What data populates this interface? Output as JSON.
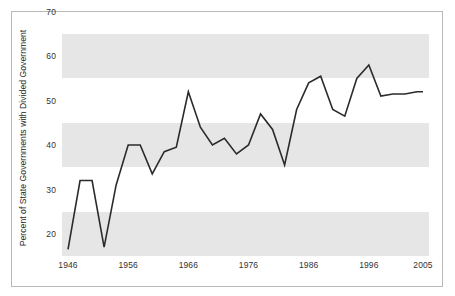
{
  "chart_data": {
    "type": "line",
    "title": "",
    "xlabel": "",
    "ylabel": "Percent of State Governments with Divided Government",
    "xlim": [
      1945,
      2006
    ],
    "ylim": [
      20,
      70
    ],
    "ytick_labels": [
      "20",
      "30",
      "40",
      "50",
      "60",
      "70"
    ],
    "ytick_values": [
      20,
      30,
      40,
      50,
      60,
      70
    ],
    "xtick_labels": [
      "1946",
      "1956",
      "1966",
      "1976",
      "1986",
      "1996",
      "2005"
    ],
    "xtick_values": [
      1946,
      1956,
      1966,
      1976,
      1986,
      1996,
      2005
    ],
    "grid": "alternating horizontal bands",
    "legend": "none",
    "line_color": "#2b2b2b",
    "band_color": "#e6e6e6",
    "plot_background": "#ffffff",
    "frame_color": "#b9b9b9",
    "x": [
      1946,
      1948,
      1950,
      1952,
      1954,
      1956,
      1958,
      1960,
      1962,
      1964,
      1966,
      1968,
      1970,
      1972,
      1974,
      1976,
      1978,
      1980,
      1982,
      1984,
      1986,
      1988,
      1990,
      1992,
      1994,
      1996,
      1998,
      2000,
      2002,
      2004,
      2005
    ],
    "values": [
      21.5,
      37.0,
      37.0,
      22.0,
      36.0,
      45.0,
      45.0,
      38.5,
      43.5,
      44.5,
      57.0,
      49.0,
      45.0,
      46.5,
      43.0,
      45.0,
      52.0,
      48.5,
      40.5,
      53.0,
      59.0,
      60.5,
      53.0,
      51.5,
      60.0,
      63.0,
      56.0,
      56.5,
      56.5,
      57.0,
      57.0
    ]
  }
}
